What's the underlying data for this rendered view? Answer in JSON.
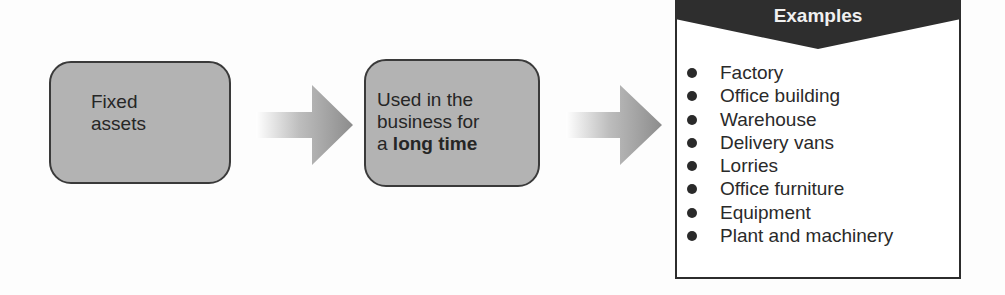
{
  "diagram": {
    "colors": {
      "box_fill": "#b3b3b3",
      "box_border": "#3a3a3a",
      "arrow_start": "#ffffff",
      "arrow_end": "#8e8e8e",
      "panel_header": "#2e2e2e",
      "panel_header_text": "#f0f0f0",
      "panel_border": "#2c2c2c",
      "text": "#2a2a2a"
    },
    "nodes": [
      {
        "id": "fixed-assets",
        "lines": [
          "Fixed",
          "assets"
        ]
      },
      {
        "id": "used-in-business",
        "line1": "Used in the",
        "line2": "business for",
        "line3_prefix": "a ",
        "line3_bold": "long time"
      }
    ],
    "arrows": [
      {
        "from": "fixed-assets",
        "to": "used-in-business",
        "icon": "right-arrow-icon"
      },
      {
        "from": "used-in-business",
        "to": "examples",
        "icon": "right-arrow-icon"
      }
    ],
    "examples": {
      "title": "Examples",
      "items": [
        "Factory",
        "Office building",
        "Warehouse",
        "Delivery vans",
        "Lorries",
        "Office furniture",
        "Equipment",
        "Plant and machinery"
      ]
    }
  }
}
